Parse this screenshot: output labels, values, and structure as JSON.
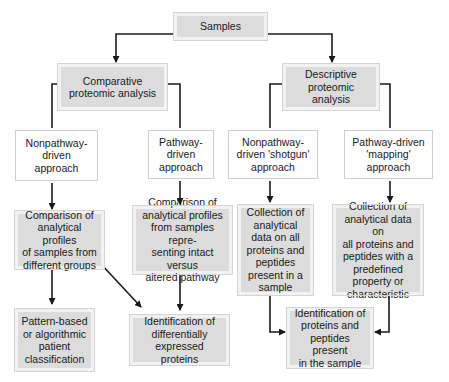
{
  "diagram": {
    "type": "flowchart",
    "colors": {
      "box_fill": "#dcdcdc",
      "line": "#1a1a1a",
      "text": "#1a1a1a"
    },
    "nodes": {
      "samples": "Samples",
      "comparative": "Comparative\nproteomic analysis",
      "descriptive": "Descriptive\nproteomic analysis",
      "comp_nonpathway": "Nonpathway-\ndriven\napproach",
      "comp_pathway": "Pathway-\ndriven\napproach",
      "desc_nonpathway": "Nonpathway-\ndriven 'shotgun'\napproach",
      "desc_pathway": "Pathway-driven\n'mapping'\napproach",
      "comparison_groups": "Comparison of\nanalytical profiles\nof samples from\ndifferent groups",
      "comparison_pathway": "Comparison of\nanalytical profiles\nfrom samples repre-\nsenting intact versus\naltered pathway",
      "collection_all": "Collection of\nanalytical\ndata on all\nproteins and\npeptides\npresent in a\nsample",
      "collection_predefined": "Collection of\nanalytical data on\nall proteins and\npeptides with a\npredefined\nproperty or\ncharacteristic",
      "pattern_classification": "Pattern-based\nor algorithmic\npatient\nclassification",
      "identification_differential": "Identification of\ndifferentially\nexpressed proteins",
      "identification_proteins": "Identification of\nproteins and\npeptides present\nin the sample"
    },
    "edges": [
      [
        "samples",
        "comparative"
      ],
      [
        "samples",
        "descriptive"
      ],
      [
        "comparative",
        "comp_nonpathway"
      ],
      [
        "comparative",
        "comp_pathway"
      ],
      [
        "descriptive",
        "desc_nonpathway"
      ],
      [
        "descriptive",
        "desc_pathway"
      ],
      [
        "comp_nonpathway",
        "comparison_groups"
      ],
      [
        "comp_pathway",
        "comparison_pathway"
      ],
      [
        "desc_nonpathway",
        "collection_all"
      ],
      [
        "desc_pathway",
        "collection_predefined"
      ],
      [
        "comparison_groups",
        "pattern_classification"
      ],
      [
        "comparison_groups",
        "identification_differential"
      ],
      [
        "comparison_pathway",
        "identification_differential"
      ],
      [
        "collection_all",
        "identification_proteins"
      ],
      [
        "collection_predefined",
        "identification_proteins"
      ]
    ]
  }
}
